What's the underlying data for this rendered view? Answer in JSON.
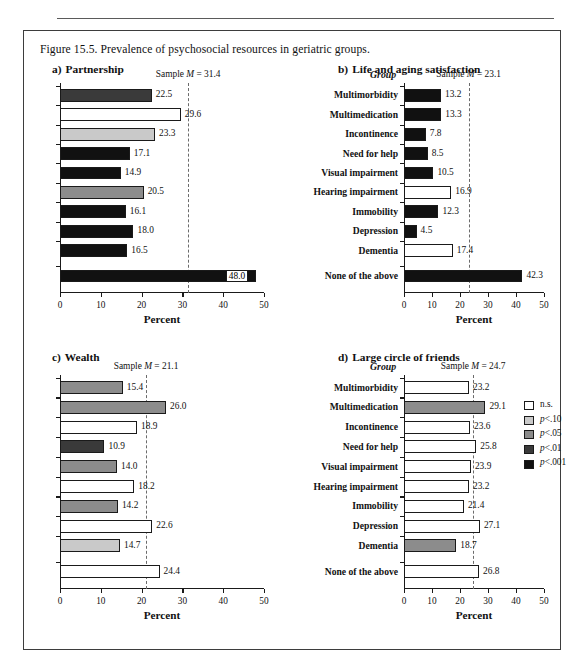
{
  "figure": {
    "caption": "Figure 15.5. Prevalence of psychosocial resources in geriatric groups.",
    "xlabel": "Percent",
    "group_header": "Group",
    "axis_ticks": [
      "0",
      "10",
      "20",
      "30",
      "40",
      "50"
    ]
  },
  "groups": [
    "Multimorbidity",
    "Multimedication",
    "Incontinence",
    "Need for help",
    "Visual impairment",
    "Hearing impairment",
    "Immobility",
    "Depression",
    "Dementia",
    "None of the above"
  ],
  "legend": {
    "items": [
      {
        "label": "n.s.",
        "color": "#ffffff"
      },
      {
        "label": "p<.10",
        "color": "#c9c9c9"
      },
      {
        "label": "p<.05",
        "color": "#8c8c8c"
      },
      {
        "label": "p<.01",
        "color": "#3a3a3a"
      },
      {
        "label": "p<.001",
        "color": "#111111"
      }
    ]
  },
  "chart_data": [
    {
      "type": "bar",
      "panel": "a",
      "title": "Partnership",
      "letter": "a)",
      "xlabel": "Percent",
      "ylabel": "Group",
      "xlim": [
        0,
        50
      ],
      "xticks": [
        0,
        10,
        20,
        30,
        40,
        50
      ],
      "grid": false,
      "orientation": "horizontal",
      "sample_mean": 31.4,
      "sample_mean_label": "Sample M = 31.4",
      "categories": [
        "Multimorbidity",
        "Multimedication",
        "Incontinence",
        "Need for help",
        "Visual impairment",
        "Hearing impairment",
        "Immobility",
        "Depression",
        "Dementia",
        "None of the above"
      ],
      "values": [
        22.5,
        29.6,
        23.3,
        17.1,
        14.9,
        20.5,
        16.1,
        18.0,
        16.5,
        48.0
      ],
      "value_labels": [
        "22.5",
        "29.6",
        "23.3",
        "17.1",
        "14.9",
        "20.5",
        "16.1",
        "18.0",
        "16.5",
        "48.0"
      ],
      "fills": [
        "#3a3a3a",
        "#ffffff",
        "#c9c9c9",
        "#111111",
        "#111111",
        "#8c8c8c",
        "#111111",
        "#111111",
        "#111111",
        "#111111"
      ],
      "label_inside": [
        false,
        false,
        false,
        false,
        false,
        false,
        false,
        false,
        false,
        true
      ]
    },
    {
      "type": "bar",
      "panel": "b",
      "title": "Life and aging satisfaction",
      "letter": "b)",
      "xlabel": "Percent",
      "ylabel": "Group",
      "xlim": [
        0,
        50
      ],
      "xticks": [
        0,
        10,
        20,
        30,
        40,
        50
      ],
      "grid": false,
      "orientation": "horizontal",
      "sample_mean": 23.1,
      "sample_mean_label": "Sample M = 23.1",
      "categories": [
        "Multimorbidity",
        "Multimedication",
        "Incontinence",
        "Need for help",
        "Visual impairment",
        "Hearing impairment",
        "Immobility",
        "Depression",
        "Dementia",
        "None of the above"
      ],
      "values": [
        13.2,
        13.3,
        7.8,
        8.5,
        10.5,
        16.9,
        12.3,
        4.5,
        17.4,
        42.3
      ],
      "value_labels": [
        "13.2",
        "13.3",
        "7.8",
        "8.5",
        "10.5",
        "16.9",
        "12.3",
        "4.5",
        "17.4",
        "42.3"
      ],
      "fills": [
        "#111111",
        "#111111",
        "#111111",
        "#111111",
        "#111111",
        "#ffffff",
        "#111111",
        "#111111",
        "#ffffff",
        "#111111"
      ],
      "label_inside": [
        false,
        false,
        false,
        false,
        false,
        false,
        false,
        false,
        false,
        false
      ]
    },
    {
      "type": "bar",
      "panel": "c",
      "title": "Wealth",
      "letter": "c)",
      "xlabel": "Percent",
      "ylabel": "Group",
      "xlim": [
        0,
        50
      ],
      "xticks": [
        0,
        10,
        20,
        30,
        40,
        50
      ],
      "grid": false,
      "orientation": "horizontal",
      "sample_mean": 21.1,
      "sample_mean_label": "Sample M = 21.1",
      "categories": [
        "Multimorbidity",
        "Multimedication",
        "Incontinence",
        "Need for help",
        "Visual impairment",
        "Hearing impairment",
        "Immobility",
        "Depression",
        "Dementia",
        "None of the above"
      ],
      "values": [
        15.4,
        26.0,
        18.9,
        10.9,
        14.0,
        18.2,
        14.2,
        22.6,
        14.7,
        24.4
      ],
      "value_labels": [
        "15.4",
        "26.0",
        "18.9",
        "10.9",
        "14.0",
        "18.2",
        "14.2",
        "22.6",
        "14.7",
        "24.4"
      ],
      "fills": [
        "#8c8c8c",
        "#8c8c8c",
        "#ffffff",
        "#3a3a3a",
        "#8c8c8c",
        "#ffffff",
        "#8c8c8c",
        "#ffffff",
        "#c9c9c9",
        "#ffffff"
      ],
      "label_inside": [
        false,
        false,
        false,
        false,
        false,
        false,
        false,
        false,
        false,
        false
      ]
    },
    {
      "type": "bar",
      "panel": "d",
      "title": "Large circle of friends",
      "letter": "d)",
      "xlabel": "Percent",
      "ylabel": "Group",
      "xlim": [
        0,
        50
      ],
      "xticks": [
        0,
        10,
        20,
        30,
        40,
        50
      ],
      "grid": false,
      "orientation": "horizontal",
      "sample_mean": 24.7,
      "sample_mean_label": "Sample M = 24.7",
      "categories": [
        "Multimorbidity",
        "Multimedication",
        "Incontinence",
        "Need for help",
        "Visual impairment",
        "Hearing impairment",
        "Immobility",
        "Depression",
        "Dementia",
        "None of the above"
      ],
      "values": [
        23.2,
        29.1,
        23.6,
        25.8,
        23.9,
        23.2,
        21.4,
        27.1,
        18.7,
        26.8
      ],
      "value_labels": [
        "23.2",
        "29.1",
        "23.6",
        "25.8",
        "23.9",
        "23.2",
        "21.4",
        "27.1",
        "18.7",
        "26.8"
      ],
      "fills": [
        "#ffffff",
        "#8c8c8c",
        "#ffffff",
        "#ffffff",
        "#ffffff",
        "#ffffff",
        "#ffffff",
        "#ffffff",
        "#8c8c8c",
        "#ffffff"
      ],
      "label_inside": [
        false,
        false,
        false,
        false,
        false,
        false,
        false,
        false,
        false,
        false
      ]
    }
  ]
}
